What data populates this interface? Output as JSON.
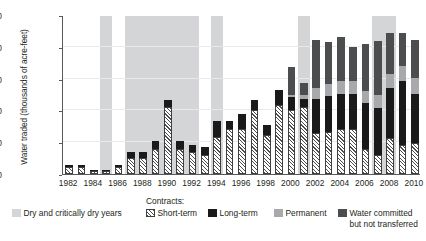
{
  "chart_data": {
    "type": "bar",
    "stacked": true,
    "title": "",
    "xlabel": "",
    "ylabel": "Water traded (thousands of acre-feet)",
    "ylim": [
      0,
      2500
    ],
    "ytick_labels": [
      "0",
      "500",
      "1,000",
      "1,500",
      "2,000",
      "2,500"
    ],
    "ytick_values": [
      0,
      500,
      1000,
      1500,
      2000,
      2500
    ],
    "grid": true,
    "legend_position": "below",
    "x": [
      1982,
      1983,
      1984,
      1985,
      1986,
      1987,
      1988,
      1989,
      1990,
      1991,
      1992,
      1993,
      1994,
      1995,
      1996,
      1997,
      1998,
      1999,
      2000,
      2001,
      2002,
      2003,
      2004,
      2005,
      2006,
      2007,
      2008,
      2009,
      2010
    ],
    "xtick_labels": [
      "1982",
      "1984",
      "1986",
      "1988",
      "1990",
      "1992",
      "1994",
      "1996",
      "1998",
      "2000",
      "2002",
      "2004",
      "2006",
      "2008",
      "2010"
    ],
    "xtick_values": [
      1982,
      1984,
      1986,
      1988,
      1990,
      1992,
      1994,
      1996,
      1998,
      2000,
      2002,
      2004,
      2006,
      2008,
      2010
    ],
    "series": [
      {
        "name": "Short-term",
        "key": "short",
        "color": "#ffffff",
        "pattern": "diagonal-hatch",
        "values": [
          110,
          110,
          40,
          40,
          110,
          250,
          250,
          400,
          1050,
          400,
          350,
          300,
          580,
          700,
          700,
          1000,
          620,
          1090,
          1000,
          1050,
          640,
          660,
          700,
          700,
          390,
          300,
          560,
          460,
          480
        ]
      },
      {
        "name": "Long-term",
        "key": "long",
        "color": "#1a1a1a",
        "values": [
          30,
          30,
          10,
          10,
          30,
          90,
          90,
          120,
          110,
          120,
          110,
          120,
          250,
          140,
          250,
          160,
          150,
          230,
          210,
          130,
          540,
          560,
          560,
          560,
          720,
          740,
          800,
          1000,
          780
        ]
      },
      {
        "name": "Permanent",
        "key": "perm",
        "color": "#a7a9ac",
        "values": [
          0,
          0,
          0,
          0,
          0,
          0,
          0,
          0,
          0,
          0,
          0,
          0,
          0,
          0,
          0,
          0,
          0,
          0,
          30,
          60,
          180,
          200,
          200,
          200,
          200,
          200,
          220,
          240,
          250
        ]
      },
      {
        "name": "Water committed but not transferred",
        "key": "comm",
        "color": "#4c4d4f",
        "values": [
          0,
          0,
          0,
          0,
          0,
          0,
          0,
          0,
          0,
          0,
          0,
          0,
          0,
          0,
          0,
          0,
          0,
          0,
          450,
          190,
          750,
          650,
          690,
          540,
          730,
          850,
          640,
          510,
          600
        ]
      }
    ],
    "dry_year_bands": [
      {
        "start": 1985,
        "end": 1985
      },
      {
        "start": 1987,
        "end": 1992
      },
      {
        "start": 1994,
        "end": 1994
      },
      {
        "start": 2001,
        "end": 2001
      },
      {
        "start": 2007,
        "end": 2008
      }
    ]
  },
  "legend": {
    "contracts_label": "Contracts:",
    "items": [
      {
        "label": "Dry and critically dry years",
        "swatch": "sw-dry",
        "name": "legend-dry-years"
      },
      {
        "label": "Short-term",
        "swatch": "sw-short",
        "name": "legend-short-term"
      },
      {
        "label": "Long-term",
        "swatch": "sw-long",
        "name": "legend-long-term"
      },
      {
        "label": "Permanent",
        "swatch": "sw-perm",
        "name": "legend-permanent"
      },
      {
        "label": "Water committed",
        "label2": "but not transferred",
        "swatch": "sw-comm",
        "name": "legend-water-committed"
      }
    ]
  },
  "colors": {
    "dry_band": "#d4d5d7",
    "long_term": "#1a1a1a",
    "permanent": "#a7a9ac",
    "water_committed": "#4c4d4f",
    "axis": "#58595b",
    "grid": "#e8e9ea"
  }
}
